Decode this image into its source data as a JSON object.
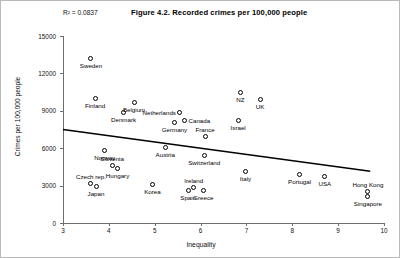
{
  "figure": {
    "title": "Figure 4.2. Recorded crimes per 100,000 people",
    "r_squared_label": "R",
    "r_squared_sup": "2",
    "r_squared_value": "= 0.0837",
    "r_squared_full": "R² = 0.0837"
  },
  "chart_data": {
    "type": "scatter",
    "title": "Figure 4.2. Recorded crimes per 100,000 people",
    "xlabel": "Inequality",
    "ylabel": "Crimes per 100,000 people",
    "xlim": [
      3,
      10
    ],
    "ylim": [
      0,
      15000
    ],
    "xticks": [
      "3",
      "4",
      "5",
      "6",
      "7",
      "8",
      "9",
      "10"
    ],
    "xtick_values": [
      3,
      4,
      5,
      6,
      7,
      8,
      9,
      10
    ],
    "yticks": [
      "0",
      "3000",
      "6000",
      "9000",
      "12000",
      "15000"
    ],
    "ytick_values": [
      0,
      3000,
      6000,
      9000,
      12000,
      15000
    ],
    "grid": false,
    "legend": "none",
    "annotations": [
      "R² = 0.0837"
    ],
    "trendline": {
      "type": "linear",
      "x_start": 3.0,
      "y_start": 7500,
      "x_end": 9.7,
      "y_end": 4150,
      "r_squared": 0.0837
    },
    "points": [
      {
        "name": "Sweden",
        "x": 3.61,
        "y": 13170,
        "label_pos": "below"
      },
      {
        "name": "Finland",
        "x": 3.7,
        "y": 9960,
        "label_pos": "below"
      },
      {
        "name": "Belgium",
        "x": 4.55,
        "y": 9640,
        "label_pos": "below"
      },
      {
        "name": "Denmark",
        "x": 4.32,
        "y": 8840,
        "label_pos": "below"
      },
      {
        "name": "Netherlands",
        "x": 5.55,
        "y": 8840,
        "label_pos": "left"
      },
      {
        "name": "Canada",
        "x": 5.65,
        "y": 8200,
        "label_pos": "right"
      },
      {
        "name": "Germany",
        "x": 5.43,
        "y": 8040,
        "label_pos": "below"
      },
      {
        "name": "NZ",
        "x": 6.87,
        "y": 10430,
        "label_pos": "below"
      },
      {
        "name": "UK",
        "x": 7.3,
        "y": 9880,
        "label_pos": "below"
      },
      {
        "name": "Israel",
        "x": 6.82,
        "y": 8200,
        "label_pos": "below"
      },
      {
        "name": "France",
        "x": 6.1,
        "y": 6910,
        "label_pos": "above"
      },
      {
        "name": "Norway",
        "x": 3.91,
        "y": 5790,
        "label_pos": "below"
      },
      {
        "name": "Austria",
        "x": 5.23,
        "y": 6030,
        "label_pos": "below"
      },
      {
        "name": "Switzerland",
        "x": 6.08,
        "y": 5390,
        "label_pos": "below"
      },
      {
        "name": "Slovenia",
        "x": 4.07,
        "y": 4590,
        "label_pos": "above"
      },
      {
        "name": "Hungary",
        "x": 4.19,
        "y": 4350,
        "label_pos": "below"
      },
      {
        "name": "Italy",
        "x": 6.98,
        "y": 4110,
        "label_pos": "below"
      },
      {
        "name": "Portugal",
        "x": 8.16,
        "y": 3870,
        "label_pos": "below"
      },
      {
        "name": "USA",
        "x": 8.71,
        "y": 3710,
        "label_pos": "below"
      },
      {
        "name": "Czech rep.",
        "x": 3.61,
        "y": 3150,
        "label_pos": "above"
      },
      {
        "name": "Japan",
        "x": 3.72,
        "y": 2910,
        "label_pos": "below"
      },
      {
        "name": "Korea",
        "x": 4.95,
        "y": 3070,
        "label_pos": "below"
      },
      {
        "name": "Ireland",
        "x": 5.85,
        "y": 2830,
        "label_pos": "above"
      },
      {
        "name": "Spain",
        "x": 5.73,
        "y": 2590,
        "label_pos": "below"
      },
      {
        "name": "Greece",
        "x": 6.06,
        "y": 2590,
        "label_pos": "below"
      },
      {
        "name": "Hong Kong",
        "x": 9.65,
        "y": 2510,
        "label_pos": "above"
      },
      {
        "name": "Singapore",
        "x": 9.65,
        "y": 2110,
        "label_pos": "below"
      }
    ]
  }
}
